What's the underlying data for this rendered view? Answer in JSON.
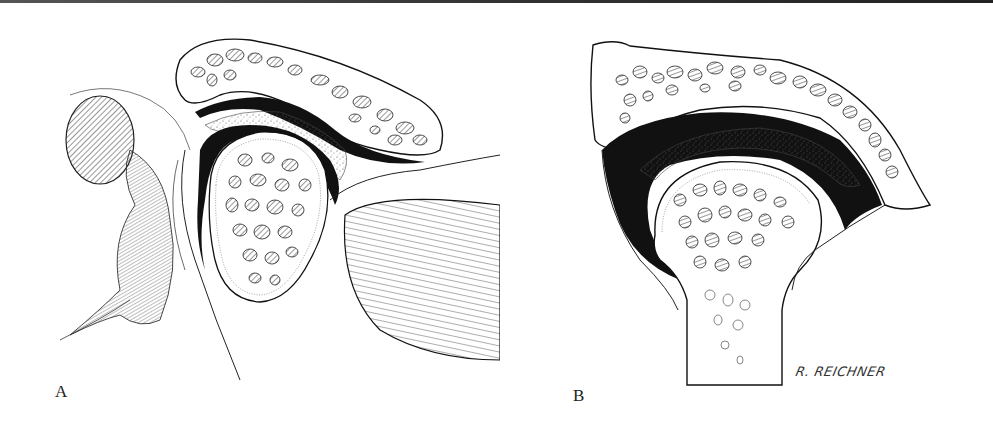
{
  "figure": {
    "panels": [
      {
        "id": "A",
        "label": "A",
        "subject": "joint cross-section with condyle in fossa, articular disc, and muscle fibers"
      },
      {
        "id": "B",
        "label": "B",
        "subject": "joint cross-section with rounded bone head in socket"
      }
    ],
    "signature": "R. REICHNER",
    "colors": {
      "ink": "#1a1a1a",
      "background": "#ffffff",
      "hatch": "#444444"
    }
  }
}
